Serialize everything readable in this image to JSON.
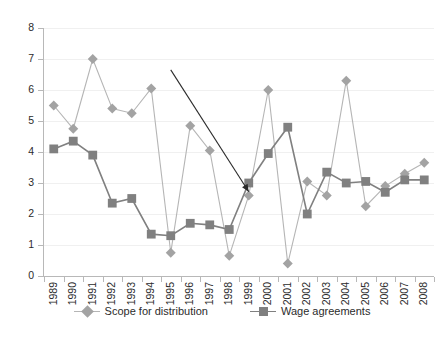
{
  "chart_data": {
    "type": "line",
    "title": "",
    "subtitle": "",
    "xlabel": "",
    "ylabel": "",
    "ylim": [
      0,
      8
    ],
    "ytick_step": 1,
    "yticks": [
      "0",
      "1",
      "2",
      "3",
      "4",
      "5",
      "6",
      "7",
      "8"
    ],
    "grid": true,
    "grid_axis": "y",
    "legend_position": "bottom-center",
    "categories": [
      "1989",
      "1990",
      "1991",
      "1992",
      "1993",
      "1994",
      "1995",
      "1996",
      "1997",
      "1998",
      "1999",
      "2000",
      "2001",
      "2002",
      "2003",
      "2004",
      "2005",
      "2006",
      "2007",
      "2008"
    ],
    "series": [
      {
        "name": "Scope for distribution",
        "marker": "diamond",
        "color": "#a3a3a3",
        "line_color": "#b5b5b5",
        "values": [
          5.5,
          4.75,
          7.0,
          5.4,
          5.25,
          6.05,
          0.75,
          4.85,
          4.05,
          0.65,
          2.6,
          6.0,
          0.4,
          3.05,
          2.6,
          6.3,
          2.25,
          2.9,
          3.3,
          3.65
        ]
      },
      {
        "name": "Wage agreements",
        "marker": "square",
        "color": "#808080",
        "line_color": "#808080",
        "values": [
          4.1,
          4.35,
          3.9,
          2.35,
          2.5,
          1.35,
          1.3,
          1.7,
          1.65,
          1.5,
          3.0,
          3.95,
          4.8,
          2.0,
          3.35,
          3.0,
          3.05,
          2.7,
          3.1,
          3.1
        ]
      }
    ],
    "annotations": [
      {
        "type": "arrow",
        "color": "#2b2b2b",
        "from_x": 1995.0,
        "from_y": 6.65,
        "to_x": 1999.0,
        "to_y": 2.72
      }
    ]
  },
  "legend": {
    "items": [
      {
        "label": "Scope for distribution"
      },
      {
        "label": "Wage agreements"
      }
    ]
  },
  "colors": {
    "axis": "#b8b8b8",
    "grid": "#f0f0f0",
    "text": "#2b2b2b",
    "background": "#ffffff",
    "series_scope": "#a3a3a3",
    "series_wage": "#808080",
    "annotation": "#2b2b2b"
  }
}
